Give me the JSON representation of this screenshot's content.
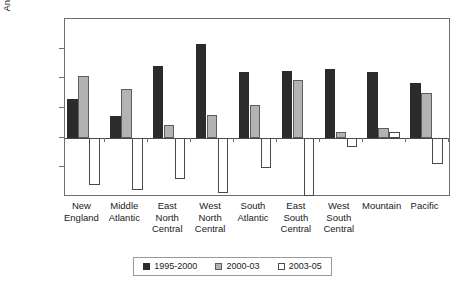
{
  "chart_data": {
    "type": "bar",
    "title": "",
    "subtitle": "",
    "xlabel": "",
    "ylabel": "Annualized percentage growth",
    "ylim": [
      -2.0,
      4.0
    ],
    "ytick_values": [
      4.0,
      3.0,
      2.0,
      1.0,
      0.0,
      -1.0,
      -2.0
    ],
    "ytick_labels": [
      "4.0%",
      "3.0%",
      "2.0%",
      "1.0%",
      "0.0%",
      "-1.0%",
      "-2.0%"
    ],
    "grid": false,
    "legend_position": "bottom",
    "categories": [
      "New England",
      "Middle Atlantic",
      "East North Central",
      "West North Central",
      "South Atlantic",
      "East South Central",
      "West South Central",
      "Mountain",
      "Pacific"
    ],
    "category_lines": [
      [
        "New",
        "England"
      ],
      [
        "Middle",
        "Atlantic"
      ],
      [
        "East",
        "North",
        "Central"
      ],
      [
        "West",
        "North",
        "Central"
      ],
      [
        "South",
        "Atlantic"
      ],
      [
        "East",
        "South",
        "Central"
      ],
      [
        "West",
        "South",
        "Central"
      ],
      [
        "Mountain"
      ],
      [
        "Pacific"
      ]
    ],
    "series": [
      {
        "name": "1995-2000",
        "color": "#2b2b2b",
        "values": [
          1.3,
          0.72,
          2.42,
          3.17,
          2.2,
          2.25,
          2.33,
          2.22,
          1.85
        ]
      },
      {
        "name": "2000-03",
        "color": "#b3b3b3",
        "values": [
          2.07,
          1.63,
          0.42,
          0.75,
          1.1,
          1.93,
          0.18,
          0.32,
          1.5
        ]
      },
      {
        "name": "2003-05",
        "color": "#ffffff",
        "values": [
          -1.6,
          -1.78,
          -1.38,
          -1.88,
          -1.02,
          -1.95,
          -0.3,
          0.2,
          -0.88
        ]
      }
    ]
  },
  "legend": {
    "items": [
      {
        "label": "1995-2000"
      },
      {
        "label": "2000-03"
      },
      {
        "label": "2003-05"
      }
    ]
  }
}
